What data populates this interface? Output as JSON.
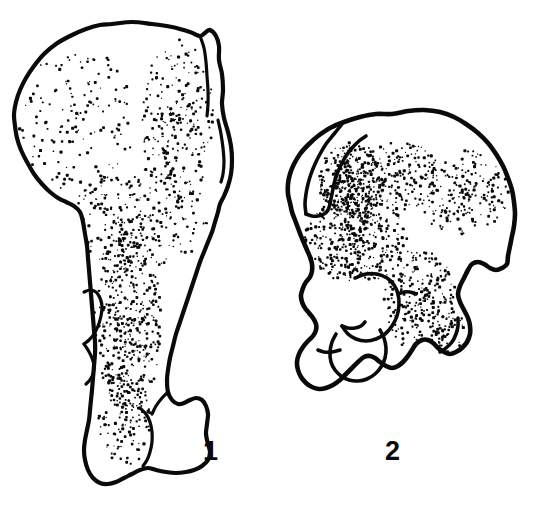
{
  "figure": {
    "kind": "scientific-line-drawing",
    "background_color": "#ffffff",
    "ink_color": "#0a0a0a",
    "width": 541,
    "height": 506
  },
  "labels": [
    {
      "id": "label-1",
      "text": "1",
      "x": 203,
      "y": 438
    },
    {
      "id": "label-2",
      "text": "2",
      "x": 385,
      "y": 438
    }
  ],
  "specimens": [
    {
      "name": "specimen-1",
      "label": "1",
      "description": "Elongate ilium, blade expanded at top, shaft tapering downward to a blocky distal end",
      "bbox": [
        14,
        22,
        236,
        496
      ],
      "outline_points": "112,24 132,22 152,24 172,27 190,32 200,36 206,32 210,30 216,36 219,46 219,60 222,74 223,90 222,104 224,118 228,132 231,146 232,160 231,174 228,186 224,196 220,204 218,212 215,222 212,232 208,242 204,252 200,262 196,274 192,286 188,298 184,310 180,322 176,334 173,346 170,358 168,370 167,380 168,392 172,400 178,404 184,403 190,400 196,398 202,400 206,406 208,414 207,424 206,434 208,444 210,452 208,460 202,466 194,470 186,472 176,473 166,472 156,470 148,468 140,470 132,474 124,478 116,482 108,484 100,483 93,478 88,470 85,460 84,450 85,440 87,430 89,420 90,410 91,400 92,390 93,378 94,366 95,354 95,342 94,330 93,318 92,306 91,294 90,282 89,270 88,258 87,246 85,234 83,222 80,212 74,206 66,202 58,198 50,192 42,184 34,174 27,162 21,150 17,138 15,126 14,114 16,102 20,90 26,78 34,66 44,54 56,44 70,36 86,29 100,25",
      "detail_lines": [
        "200,36 204,48 206,62 207,76 208,90 208,104 207,116",
        "218,120 221,134 223,148 224,162 223,174 221,182",
        "84,292 90,290 96,292 100,298 102,306 101,316 98,326 94,334 89,340 84,344",
        "84,344 88,350 92,358 94,366 93,374 90,380 86,384",
        "140,408 146,414 150,422 152,432 152,442 150,452 147,460 143,466",
        "168,392 162,398 156,406 152,414"
      ],
      "stipple_regions": [
        {
          "cx": 78,
          "cy": 120,
          "rx": 60,
          "ry": 72,
          "count": 200,
          "density": "light"
        },
        {
          "cx": 178,
          "cy": 120,
          "rx": 36,
          "ry": 82,
          "count": 230,
          "density": "medium"
        },
        {
          "cx": 140,
          "cy": 218,
          "rx": 68,
          "ry": 52,
          "count": 260,
          "density": "medium"
        },
        {
          "cx": 128,
          "cy": 320,
          "rx": 34,
          "ry": 92,
          "count": 300,
          "density": "heavy"
        },
        {
          "cx": 124,
          "cy": 420,
          "rx": 26,
          "ry": 48,
          "count": 130,
          "density": "medium"
        }
      ]
    },
    {
      "name": "specimen-2",
      "label": "2",
      "description": "Foreshortened ilium seen at an angle, broad fan-shaped blade above, acetabular region below",
      "bbox": [
        288,
        110,
        516,
        400
      ],
      "outline_points": "392,114 408,111 424,110 440,112 454,117 466,124 478,133 488,143 496,154 503,166 508,178 512,190 514,202 515,214 514,226 512,236 510,246 508,256 507,264 502,268 496,270 490,268 484,264 478,262 472,264 468,270 464,278 460,286 458,294 460,302 464,310 468,318 470,326 470,334 467,342 462,348 456,352 450,354 444,352 438,348 433,343 428,340 422,340 416,344 412,350 408,356 403,362 398,366 392,368 386,366 380,362 375,358 370,356 364,357 358,362 352,368 346,374 340,380 333,385 326,388 319,389 312,387 306,383 301,377 298,370 297,362 299,354 303,347 308,341 313,336 316,330 316,324 313,318 309,313 305,308 302,302 301,295 303,288 306,282 310,277 312,271 312,264 310,257 307,250 304,243 301,236 298,228 295,220 292,212 290,203 288,194 288,184 290,174 294,164 300,154 308,145 318,136 330,128 344,122 360,117 376,114",
      "detail_lines": [
        "342,124 334,134 326,144 320,154 315,164 311,174 308,184 306,194 305,204 306,214",
        "306,214 312,216 318,216 324,214 328,210 330,204",
        "330,204 332,194 334,184 337,174 341,165 346,156 352,148 359,141 366,136",
        "355,278 366,274 377,274 387,278 394,285 398,294 399,305 397,316 392,326 385,334 376,339 366,341 356,339 348,334 342,326",
        "342,326 348,328 355,328 361,326 365,322",
        "336,334 332,342 330,352 331,362 335,370 341,376 349,380 358,381 367,379 375,374 381,367 385,358 386,348 384,338 380,330",
        "318,350 324,352 332,352 340,350",
        "398,294 404,292 410,292 416,294",
        "440,352 446,348 452,342 456,334 458,326 458,318"
      ],
      "stipple_regions": [
        {
          "cx": 352,
          "cy": 182,
          "rx": 34,
          "ry": 40,
          "count": 260,
          "density": "heavy"
        },
        {
          "cx": 400,
          "cy": 176,
          "rx": 42,
          "ry": 34,
          "count": 180,
          "density": "medium"
        },
        {
          "cx": 462,
          "cy": 192,
          "rx": 48,
          "ry": 42,
          "count": 200,
          "density": "medium"
        },
        {
          "cx": 356,
          "cy": 240,
          "rx": 52,
          "ry": 44,
          "count": 280,
          "density": "heavy"
        },
        {
          "cx": 420,
          "cy": 300,
          "rx": 36,
          "ry": 52,
          "count": 240,
          "density": "medium"
        },
        {
          "cx": 440,
          "cy": 330,
          "rx": 26,
          "ry": 26,
          "count": 80,
          "density": "light"
        }
      ]
    }
  ]
}
